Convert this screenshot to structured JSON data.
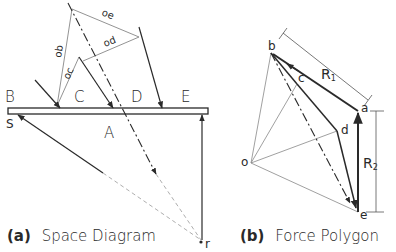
{
  "space_diagram": {
    "caption_prefix": "(a)",
    "caption": "Space Diagram",
    "regions": {
      "B": "B",
      "C": "C",
      "D": "D",
      "E": "E",
      "A": "A"
    },
    "support_left": "S",
    "point_r": "r",
    "ray_labels": {
      "ob": "ob",
      "oc": "oc",
      "od": "od",
      "oe": "oe"
    }
  },
  "force_polygon": {
    "caption_prefix": "(b)",
    "caption": "Force Polygon",
    "vertices": {
      "a": "a",
      "b": "b",
      "c": "c",
      "d": "d",
      "e": "e",
      "o": "o"
    },
    "resultants": {
      "R1": "R",
      "R1_sub": "1",
      "R2": "R",
      "R2_sub": "2"
    }
  },
  "colors": {
    "line": "#2a2a2a",
    "thin": "#777777",
    "bg": "#ffffff"
  }
}
